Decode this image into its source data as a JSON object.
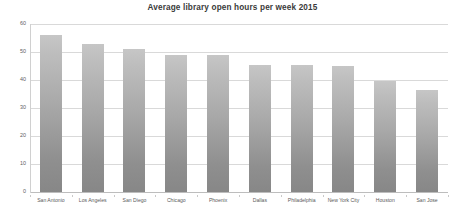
{
  "chart_data": {
    "type": "bar",
    "title": "Average library open hours per week 2015",
    "xlabel": "",
    "ylabel": "",
    "ylim": [
      0,
      60
    ],
    "yticks": [
      0,
      10,
      20,
      30,
      40,
      50,
      60
    ],
    "grid": true,
    "legend": false,
    "legend_position": "none",
    "categories": [
      "San Antonio",
      "Los Angeles",
      "San Diego",
      "Chicago",
      "Phoenix",
      "Dallas",
      "Philadelphia",
      "New York City",
      "Houston",
      "San Jose"
    ],
    "values": [
      56,
      53,
      51,
      49,
      49,
      45.5,
      45.5,
      45,
      39.5,
      36.5
    ],
    "bar_color_top": "#c6c6c6",
    "bar_color_bottom": "#878787",
    "gridline_color": "#d9d9d9",
    "title_color": "#3a3a3a",
    "tick_label_color": "#5a5a5a"
  }
}
